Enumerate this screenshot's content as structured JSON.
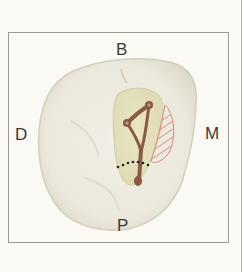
{
  "diagram": {
    "type": "tooth-occlusal-view",
    "labels": {
      "top": "B",
      "bottom": "P",
      "left": "D",
      "right": "M"
    },
    "colors": {
      "frame_border": "#9c9a96",
      "background": "#faf9f4",
      "tooth_fill": "#ebe8dc",
      "tooth_edge": "#d6d2c2",
      "access_cavity": "#e6e3bf",
      "canal": "#8a5a44",
      "hatch": "#d98a82",
      "dotted_line": "#222222"
    }
  }
}
